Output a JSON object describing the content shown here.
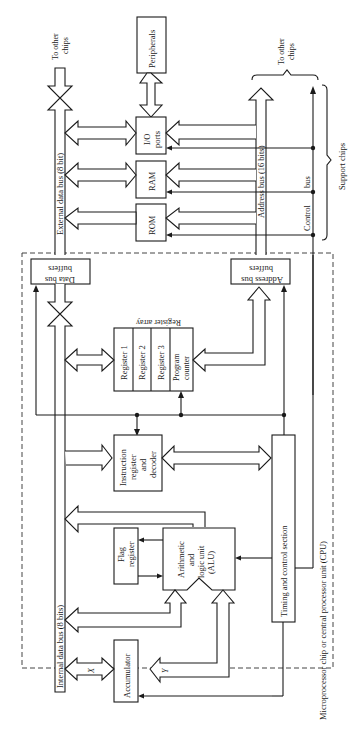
{
  "diagram": {
    "title": "Microprocessor chip or central processor unit (CPU)",
    "orientation": "rotated 90 degrees counter-clockwise",
    "external": {
      "to_other_chips_data": [
        "To other",
        "chips"
      ],
      "to_other_chips_addr": [
        "To other",
        "chips"
      ],
      "peripherals": "Peripherals",
      "io_ports": [
        "I/O",
        "ports"
      ],
      "ram": "RAM",
      "rom": "ROM",
      "external_data_bus": "External data bus (8 bit)",
      "address_bus": "Address bus (16 bits)",
      "control_bus_1": "Control",
      "control_bus_2": "bus",
      "support_chips": "Support chips"
    },
    "cpu": {
      "data_bus_buffers": [
        "Data bus",
        "buffers"
      ],
      "address_bus_buffers": [
        "Address bus",
        "buffers"
      ],
      "register_array_title": "Register array",
      "registers": [
        "Register 1",
        "Register 2",
        "Register 3",
        "Program",
        "counter"
      ],
      "instruction_register": [
        "Instruction",
        "register",
        "and",
        "decoder"
      ],
      "flag_register": [
        "Flag",
        "register"
      ],
      "alu": [
        "Arithmetic",
        "and",
        "logic unit",
        "(ALU)"
      ],
      "timing_control": "Timing and control section",
      "internal_data_bus": "Internal data bus (8 bits)",
      "accumulator": "Accumulator",
      "x_label": "X",
      "y_label": "Y"
    }
  }
}
